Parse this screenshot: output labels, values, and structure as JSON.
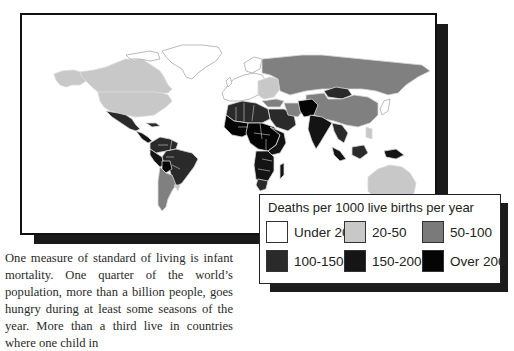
{
  "map": {
    "colors": {
      "under_20": "#ffffff",
      "20_50": "#c8c8c8",
      "50_100": "#808080",
      "100_150": "#2a2a2a",
      "150_200": "#141414",
      "over_200": "#050505",
      "border": "#d8d8d8"
    }
  },
  "legend": {
    "title": "Deaths per 1000 live births per year",
    "items": [
      {
        "label": "Under 20",
        "color": "#ffffff"
      },
      {
        "label": "20-50",
        "color": "#c8c8c8"
      },
      {
        "label": "50-100",
        "color": "#7a7a7a"
      },
      {
        "label": "100-150",
        "color": "#2a2a2a"
      },
      {
        "label": "150-200",
        "color": "#151515"
      },
      {
        "label": "Over 200",
        "color": "#050505"
      }
    ]
  },
  "caption": {
    "text": "One measure of standard of living is infant mortality. One quarter of the world’s population, more than a billion people, goes hungry during at least some seasons of the year. More than a third live in countries where one child in"
  }
}
